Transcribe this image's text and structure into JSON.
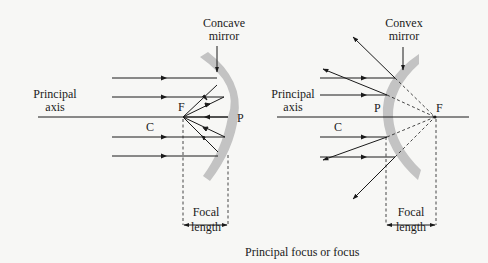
{
  "concave": {
    "title_line1": "Concave",
    "title_line2": "mirror",
    "axis_line1": "Principal",
    "axis_line2": "axis",
    "focus": "F",
    "pole": "P",
    "centre": "C",
    "focal_line1": "Focal",
    "focal_line2": "length"
  },
  "convex": {
    "title_line1": "Convex",
    "title_line2": "mirror",
    "axis_line1": "Principal",
    "axis_line2": "axis",
    "focus": "F",
    "pole": "P",
    "centre": "C",
    "focal_line1": "Focal",
    "focal_line2": "length"
  },
  "caption": "Principal focus or focus",
  "colors": {
    "mirror": "#c3c3c3",
    "ink": "#1a1a1a",
    "background": "#f7f7f5"
  }
}
